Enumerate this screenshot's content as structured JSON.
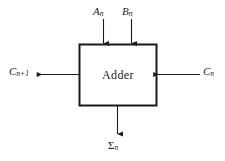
{
  "figure": {
    "background_color": "#ffffff",
    "line_color": "#1a1a1a",
    "block": {
      "label": "Adder",
      "x": 79,
      "y": 44,
      "width": 78,
      "height": 62,
      "border_color": "#1a1a1a",
      "border_width": 2,
      "fill": "#ffffff"
    },
    "signals": [
      {
        "id": "a-input",
        "text": "A",
        "subscript": "n",
        "direction": "in",
        "side": "top",
        "arrow": "down"
      },
      {
        "id": "b-input",
        "text": "B",
        "subscript": "n",
        "direction": "in",
        "side": "top",
        "arrow": "down"
      },
      {
        "id": "carry-out",
        "text": "C",
        "subscript": "n+1",
        "direction": "out",
        "side": "left",
        "arrow": "left"
      },
      {
        "id": "carry-in",
        "text": "C",
        "subscript": "n",
        "direction": "in",
        "side": "right",
        "arrow": "left"
      },
      {
        "id": "sum-output",
        "text": "Σ",
        "subscript": "n",
        "direction": "out",
        "side": "bottom",
        "arrow": "down"
      }
    ]
  }
}
